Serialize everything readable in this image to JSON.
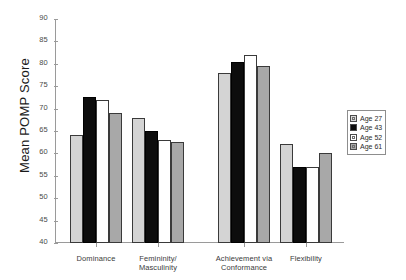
{
  "chart_data": {
    "type": "bar",
    "title": "",
    "xlabel": "",
    "ylabel": "Mean POMP Score",
    "ylim": [
      40,
      90
    ],
    "ytick_step": 5,
    "yticks": [
      "90",
      "85",
      "80",
      "75",
      "70",
      "65",
      "60",
      "55",
      "50",
      "45",
      "40"
    ],
    "grid": false,
    "legend_position": "right",
    "categories": [
      "Dominance",
      "Femininity/\nMasculinity",
      "Achievement via\nConformance",
      "Flexibility"
    ],
    "category_lines": [
      [
        "Dominance"
      ],
      [
        "Femininity/",
        "Masculinity"
      ],
      [
        "Achievement via",
        "Conformance"
      ],
      [
        "Flexibility"
      ]
    ],
    "series": [
      {
        "name": "Age 27",
        "color": "#d4d4d4",
        "values": [
          64.0,
          68.0,
          78.0,
          62.0
        ]
      },
      {
        "name": "Age 43",
        "color": "#0d0d0d",
        "values": [
          72.5,
          65.0,
          80.5,
          57.0
        ]
      },
      {
        "name": "Age 52",
        "color": "#ffffff",
        "values": [
          72.0,
          63.0,
          82.0,
          57.0
        ]
      },
      {
        "name": "Age 61",
        "color": "#a8a8a8",
        "values": [
          69.0,
          62.5,
          79.5,
          60.0
        ]
      }
    ]
  },
  "legend": {
    "entries": [
      {
        "label": "Age 27"
      },
      {
        "label": "Age 43"
      },
      {
        "label": "Age 52"
      },
      {
        "label": "Age 61"
      }
    ]
  }
}
